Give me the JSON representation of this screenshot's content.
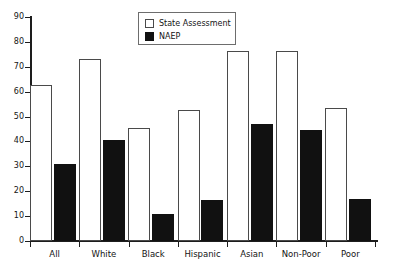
{
  "chart_data": {
    "type": "bar",
    "title": "",
    "subtitle": "",
    "xlabel": "",
    "ylabel": "",
    "ylim": [
      0,
      90
    ],
    "ytick_step": 10,
    "yticks": [
      0,
      10,
      20,
      30,
      40,
      50,
      60,
      70,
      80,
      90
    ],
    "grid": false,
    "legend_position": "top-center",
    "categories": [
      "All",
      "White",
      "Black",
      "Hispanic",
      "Asian",
      "Non-Poor",
      "Poor"
    ],
    "series": [
      {
        "name": "State Assessment",
        "color": "#ffffff",
        "edge_color": "#4a4a4a",
        "values": [
          62.5,
          73,
          45.5,
          52.5,
          76.5,
          76.5,
          53.5
        ]
      },
      {
        "name": "NAEP",
        "color": "#111111",
        "edge_color": "#111111",
        "values": [
          31,
          40.5,
          11,
          16.5,
          47,
          44.5,
          17
        ]
      }
    ]
  },
  "legend": {
    "items": [
      {
        "label": "State Assessment",
        "swatch": "open-square-swatch"
      },
      {
        "label": "NAEP",
        "swatch": "filled-square-swatch"
      }
    ]
  },
  "axes": {
    "y_tick_labels": [
      "90",
      "80",
      "70",
      "60",
      "50",
      "40",
      "30",
      "20",
      "10",
      "0"
    ],
    "x_tick_labels": [
      "All",
      "White",
      "Black",
      "Hispanic",
      "Asian",
      "Non-Poor",
      "Poor"
    ]
  }
}
